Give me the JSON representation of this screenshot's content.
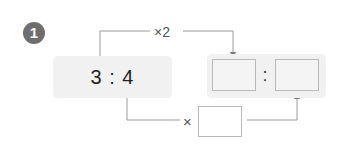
{
  "problem": {
    "number": "1",
    "ratio": {
      "left": "3",
      "separator": ":",
      "right": "4",
      "text": "3 : 4"
    },
    "top_operation": "×2",
    "bottom_operation_symbol": "×",
    "answer_separator": ":",
    "answer_boxes": [
      {
        "id": "first-term",
        "value": ""
      },
      {
        "id": "second-term",
        "value": ""
      }
    ],
    "multiplier_box": {
      "value": ""
    }
  },
  "colors": {
    "badge": "#6e6e6e",
    "panel": "#f1f1f1",
    "line": "#9a9a9a",
    "box_border": "#b8b8b8"
  }
}
